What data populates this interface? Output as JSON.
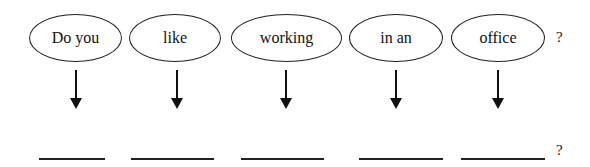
{
  "diagram": {
    "words": [
      {
        "label": "Do you"
      },
      {
        "label": "like"
      },
      {
        "label": "working"
      },
      {
        "label": "in an"
      },
      {
        "label": "office"
      }
    ],
    "top_punctuation": "?",
    "bottom_punctuation": "?",
    "blanks": [
      "",
      "",
      "",
      "",
      ""
    ]
  }
}
